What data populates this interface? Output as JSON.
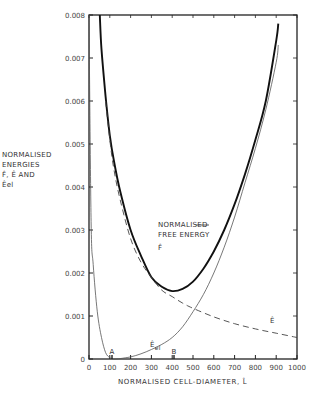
{
  "chart_data": {
    "type": "line",
    "title": "",
    "xlabel": "NORMALISED CELL-DIAMETER, L̂",
    "ylabel": "NORMALISED ENERGIES F̂, Ê AND Êel",
    "xlim": [
      0,
      1000
    ],
    "ylim": [
      0,
      0.008
    ],
    "grid": false,
    "legend": "inline annotations",
    "x_ticks": [
      0,
      100,
      200,
      300,
      400,
      500,
      600,
      700,
      800,
      900,
      1000
    ],
    "x_tick_labels": [
      "0",
      "100",
      "200",
      "300",
      "400",
      "500",
      "600",
      "700",
      "800",
      "900",
      "1000"
    ],
    "y_ticks": [
      0,
      0.001,
      0.002,
      0.003,
      0.004,
      0.005,
      0.006,
      0.007,
      0.008
    ],
    "y_tick_labels": [
      "0",
      "0.001",
      "0.002",
      "0.003",
      "0.004",
      "0.005",
      "0.006",
      "0.007",
      "0.008"
    ],
    "series": [
      {
        "name": "F̂ (normalised free energy)",
        "style": "thick solid",
        "x": [
          52,
          60,
          80,
          100,
          120,
          150,
          200,
          250,
          300,
          350,
          400,
          450,
          500,
          550,
          600,
          650,
          700,
          750,
          800,
          850,
          900,
          910
        ],
        "y": [
          0.008,
          0.0072,
          0.0061,
          0.0052,
          0.0046,
          0.0039,
          0.003,
          0.0024,
          0.0019,
          0.00168,
          0.00158,
          0.00163,
          0.0018,
          0.0021,
          0.0025,
          0.003,
          0.0036,
          0.0043,
          0.0051,
          0.006,
          0.0074,
          0.0078
        ]
      },
      {
        "name": "Ê",
        "style": "dashed",
        "x": [
          80,
          100,
          120,
          150,
          200,
          250,
          300,
          350,
          400,
          450,
          500,
          600,
          700,
          800,
          900,
          1000
        ],
        "y": [
          0.006,
          0.0051,
          0.0044,
          0.0037,
          0.0028,
          0.00225,
          0.0019,
          0.0016,
          0.00145,
          0.0013,
          0.00118,
          0.00098,
          0.00082,
          0.0007,
          0.0006,
          0.0005
        ]
      },
      {
        "name": "Êel",
        "style": "thin solid",
        "x": [
          0,
          10,
          20,
          40,
          60,
          80,
          100,
          120,
          150,
          200,
          250,
          300,
          350,
          400,
          450,
          500,
          550,
          600,
          650,
          700,
          750,
          800,
          850,
          900,
          910
        ],
        "y": [
          0.008,
          0.0032,
          0.0022,
          0.0011,
          0.0005,
          0.00015,
          3e-05,
          0.0,
          1e-05,
          5e-05,
          0.00012,
          0.00022,
          0.00034,
          0.0005,
          0.00075,
          0.0011,
          0.0015,
          0.002,
          0.0026,
          0.0033,
          0.0041,
          0.0049,
          0.0058,
          0.0069,
          0.0073
        ]
      }
    ],
    "annotations": [
      {
        "text": "NORMALISED",
        "x": 430,
        "y": 0.003
      },
      {
        "text": "FREE ENERGY",
        "x": 430,
        "y": 0.0027
      },
      {
        "text": "F̂",
        "x": 430,
        "y": 0.0024
      },
      {
        "text": "Ê",
        "x": 870,
        "y": 0.0008
      },
      {
        "text": "Êel",
        "x": 290,
        "y": 0.0003
      },
      {
        "text": "A",
        "x": 110,
        "y": 6e-05
      },
      {
        "text": "B",
        "x": 410,
        "y": 6e-05
      }
    ]
  },
  "labels": {
    "ylabel_lines": [
      "NORMALISED",
      "ENERGIES",
      "F̂, Ê AND",
      "Êel"
    ],
    "xlabel": "NORMALISED CELL-DIAMETER, L̂",
    "free_energy_line1": "NORMALISED",
    "free_energy_line2": "FREE ENERGY",
    "free_energy_symbol": "F̂",
    "e_symbol": "Ê",
    "eel_symbol": "Êel",
    "point_a": "A",
    "point_b": "B"
  }
}
